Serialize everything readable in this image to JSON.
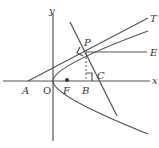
{
  "diagram": {
    "labels": {
      "y_axis": "y",
      "x_axis": "x",
      "A": "A",
      "O": "O",
      "F": "F",
      "B": "B",
      "C": "C",
      "P": "P",
      "T": "T",
      "E": "E"
    },
    "elements": [
      {
        "type": "axis",
        "name": "x-axis"
      },
      {
        "type": "axis",
        "name": "y-axis"
      },
      {
        "type": "curve",
        "name": "parabola",
        "note": "opens to the right, vertex at O"
      },
      {
        "type": "line",
        "name": "tangent",
        "from": "A",
        "through": "P",
        "to": "T"
      },
      {
        "type": "line",
        "name": "normal",
        "through": [
          "P",
          "C"
        ]
      },
      {
        "type": "line",
        "name": "horizontal-ray",
        "from": "P",
        "to": "E"
      },
      {
        "type": "dashed-line",
        "name": "perpendicular",
        "from": "P",
        "to": "B"
      },
      {
        "type": "point",
        "name": "focus",
        "label": "F"
      },
      {
        "type": "right-angle",
        "at": "P"
      },
      {
        "type": "right-angle",
        "at": "B"
      }
    ],
    "colors": {
      "stroke": "#555555",
      "text": "#333333"
    }
  }
}
